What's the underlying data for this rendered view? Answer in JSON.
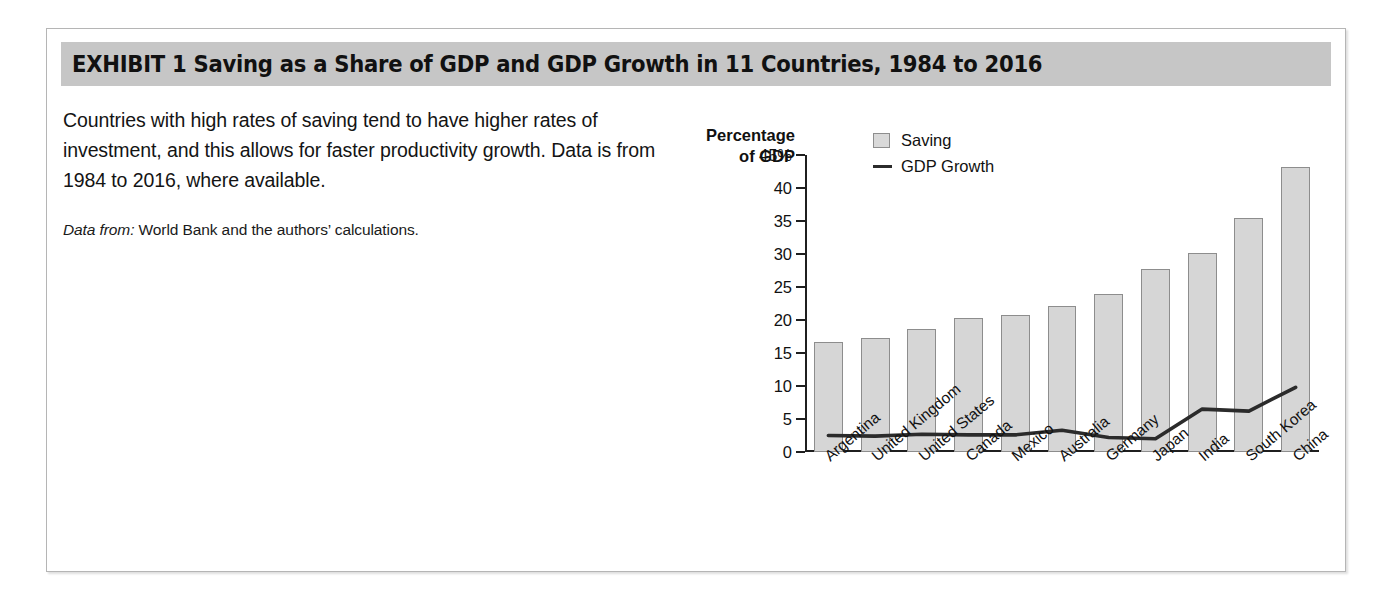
{
  "exhibit": {
    "header_title": "EXHIBIT 1   Saving as a Share of GDP and GDP Growth in 11 Countries, 1984 to 2016",
    "description": "Countries with high rates of saving tend to have higher rates of investment, and this allows for faster productivity growth. Data is from 1984 to 2016, where available.",
    "source_label": "Data from:",
    "source_text": "World Bank and the authors’ calculations."
  },
  "colors": {
    "header_band": "#c6c6c6",
    "bar_fill": "#d6d6d6",
    "bar_stroke": "#8d8d8d",
    "line": "#2b2b2b",
    "axis": "#1f1f1f",
    "panel_border": "#b5b5b5"
  },
  "chart_data": {
    "type": "bar",
    "title": "Saving as a Share of GDP and GDP Growth in 11 Countries, 1984 to 2016",
    "xlabel": "",
    "ylabel": "Percentage of GDP",
    "ylabel_line1": "Percentage",
    "ylabel_line2": "of GDP",
    "ylim": [
      0,
      45
    ],
    "yticks": [
      0,
      5,
      10,
      15,
      20,
      25,
      30,
      35,
      40,
      45
    ],
    "ytick_labels": [
      "0",
      "5",
      "10",
      "15",
      "20",
      "25",
      "30",
      "35",
      "40",
      "45%"
    ],
    "grid": false,
    "legend_position": "top-center",
    "categories": [
      "Argentina",
      "United Kingdom",
      "United States",
      "Canada",
      "Mexico",
      "Australia",
      "Germany",
      "Japan",
      "India",
      "South Korea",
      "China"
    ],
    "series": [
      {
        "name": "Saving",
        "type": "bar",
        "values": [
          16.7,
          17.3,
          18.7,
          20.3,
          20.8,
          22.1,
          23.9,
          27.8,
          30.1,
          35.5,
          43.2
        ]
      },
      {
        "name": "GDP Growth",
        "type": "line",
        "values": [
          2.5,
          2.4,
          2.7,
          2.6,
          2.6,
          3.3,
          2.2,
          2.0,
          6.5,
          6.2,
          9.8
        ]
      }
    ]
  },
  "bleed": {
    "right_block": "… … … … …\n… … … …\n… … …\n… … … …",
    "left_block": "… … … …\n… … … … …\n… … …"
  }
}
